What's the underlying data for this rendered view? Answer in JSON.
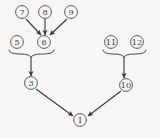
{
  "diagram": {
    "type": "directed-acyclic-graph",
    "title": "",
    "background_color": "#f7f6f4",
    "node_stroke_color": "#4a4a4a",
    "edge_color": "#3a3a3a",
    "node_shape": "circle",
    "nodes": [
      {
        "id": "n7",
        "label": "7",
        "cx": 22,
        "cy": 12
      },
      {
        "id": "n8",
        "label": "8",
        "cx": 45,
        "cy": 12
      },
      {
        "id": "n9",
        "label": "9",
        "cx": 71,
        "cy": 12
      },
      {
        "id": "n5",
        "label": "5",
        "cx": 17,
        "cy": 42
      },
      {
        "id": "n6",
        "label": "6",
        "cx": 44,
        "cy": 42
      },
      {
        "id": "n11",
        "label": "11",
        "cx": 111,
        "cy": 42
      },
      {
        "id": "n12",
        "label": "12",
        "cx": 137,
        "cy": 42
      },
      {
        "id": "n3",
        "label": "3",
        "cx": 31,
        "cy": 83
      },
      {
        "id": "n10",
        "label": "10",
        "cx": 126,
        "cy": 85
      },
      {
        "id": "n1",
        "label": "1",
        "cx": 80,
        "cy": 120
      }
    ],
    "edges": [
      {
        "id": "e7-6",
        "from": "n7",
        "to": "n6",
        "x1": 26,
        "y1": 19,
        "x2": 41,
        "y2": 35,
        "arrow": true
      },
      {
        "id": "e8-6",
        "from": "n8",
        "to": "n6",
        "x1": 45,
        "y1": 19,
        "x2": 45,
        "y2": 35,
        "arrow": true
      },
      {
        "id": "e9-6",
        "from": "n9",
        "to": "n6",
        "x1": 67,
        "y1": 19,
        "x2": 50,
        "y2": 35,
        "arrow": true
      },
      {
        "id": "e-brace-left-3",
        "from": "brace-left",
        "to": "n3",
        "x1": 31,
        "y1": 58,
        "x2": 31,
        "y2": 76,
        "arrow": true
      },
      {
        "id": "e-brace-right-10",
        "from": "brace-right",
        "to": "n10",
        "x1": 124,
        "y1": 58,
        "x2": 124,
        "y2": 78,
        "arrow": true
      },
      {
        "id": "e3-1",
        "from": "n3",
        "to": "n1",
        "x1": 36,
        "y1": 89,
        "x2": 73,
        "y2": 116,
        "arrow": true
      },
      {
        "id": "e10-1",
        "from": "n10",
        "to": "n1",
        "x1": 121,
        "y1": 91,
        "x2": 88,
        "y2": 116,
        "arrow": true
      }
    ],
    "braces": [
      {
        "id": "brace-left",
        "groups": [
          "n5",
          "n6"
        ],
        "left_x": 9,
        "right_x": 54,
        "top_y": 50,
        "center_x": 31,
        "depth_y": 58
      },
      {
        "id": "brace-right",
        "groups": [
          "n11",
          "n12"
        ],
        "left_x": 103,
        "right_x": 146,
        "top_y": 50,
        "center_x": 124,
        "depth_y": 58
      }
    ]
  }
}
